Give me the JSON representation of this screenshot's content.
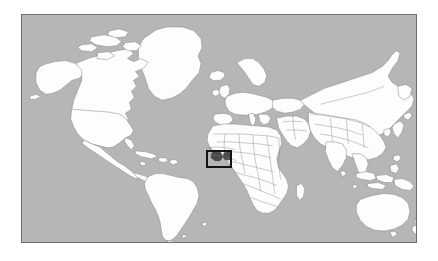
{
  "figure": {
    "type": "locator-map",
    "projection": "equirectangular",
    "background_color": "#ffffff",
    "ocean_color": "#b6b6b6",
    "land_color": "#fdfdfd",
    "border_color": "#8a8a8a",
    "frame_color": "#6e6e6e",
    "highlight_color": "#141414"
  },
  "map": {
    "frame": {
      "left_px": 21,
      "top_px": 14,
      "width_px": 396,
      "height_px": 229
    },
    "extent": {
      "lon_min": -180,
      "lon_max": 180,
      "lat_min": -60,
      "lat_max": 84
    },
    "graticule_visible": false,
    "labels_visible": false
  },
  "highlight": {
    "name": "study-area-box",
    "shape": "rectangle",
    "region_label": "West Africa",
    "left_px": 206,
    "top_px": 150,
    "width_px": 26,
    "height_px": 18,
    "stroke_px": 2,
    "stroke_color": "#141414",
    "approx_lon_min": -8,
    "approx_lon_max": 3,
    "approx_lat_min": 3,
    "approx_lat_max": 14
  },
  "continents": [
    {
      "name": "North America"
    },
    {
      "name": "South America"
    },
    {
      "name": "Europe"
    },
    {
      "name": "Africa"
    },
    {
      "name": "Asia"
    },
    {
      "name": "Australia"
    },
    {
      "name": "Greenland"
    }
  ],
  "legend": {
    "visible": false,
    "entries": []
  },
  "annotations": []
}
